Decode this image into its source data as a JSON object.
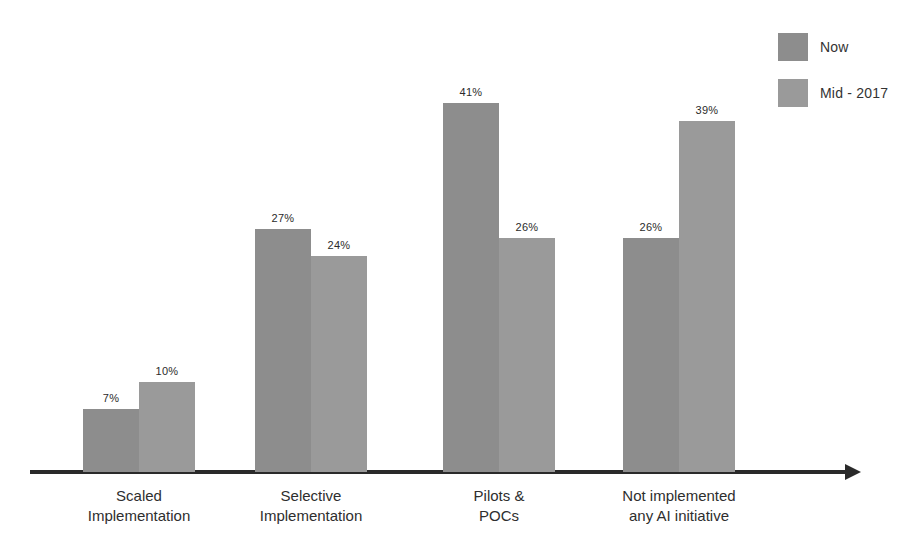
{
  "chart_data": {
    "type": "bar",
    "title": "",
    "subtitle": "",
    "xlabel": "",
    "ylabel": "",
    "ylim": [
      0,
      45
    ],
    "grid": false,
    "legend_position": "top-right",
    "value_label_suffix": "%",
    "categories": [
      {
        "line1": "Scaled",
        "line2": "Implementation"
      },
      {
        "line1": "Selective",
        "line2": "Implementation"
      },
      {
        "line1": "Pilots &",
        "line2": "POCs"
      },
      {
        "line1": "Not implemented",
        "line2": "any AI initiative"
      }
    ],
    "series": [
      {
        "name": "Now",
        "color": "#8d8d8d",
        "values": [
          7,
          27,
          41,
          26
        ],
        "labels": [
          "7%",
          "27%",
          "41%",
          "26%"
        ]
      },
      {
        "name": "Mid - 2017",
        "color": "#9a9a9a",
        "values": [
          10,
          24,
          26,
          39
        ],
        "labels": [
          "10%",
          "24%",
          "26%",
          "39%"
        ]
      }
    ]
  },
  "legend": {
    "items": [
      {
        "label": "Now",
        "color": "#8d8d8d"
      },
      {
        "label": "Mid - 2017",
        "color": "#9a9a9a"
      }
    ]
  },
  "axis": {
    "arrow_direction": "right",
    "color": "#2a2a2a"
  }
}
